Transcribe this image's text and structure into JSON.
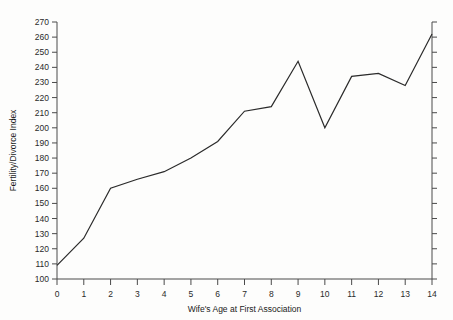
{
  "chart_data": {
    "type": "line",
    "title": "",
    "subtitle": "",
    "xlabel": "Wife's Age at First Association",
    "ylabel": "Fertility/Divorce Index",
    "x": [
      0,
      1,
      2,
      3,
      4,
      5,
      6,
      7,
      8,
      9,
      10,
      11,
      12,
      13,
      14
    ],
    "values": [
      109,
      127,
      160,
      166,
      171,
      180,
      191,
      211,
      214,
      244,
      200,
      234,
      236,
      228,
      262
    ],
    "series": [
      {
        "name": "Fertility/Divorce Index",
        "values": [
          109,
          127,
          160,
          166,
          171,
          180,
          191,
          211,
          214,
          244,
          200,
          234,
          236,
          228,
          262
        ]
      }
    ],
    "xlim": [
      0,
      14
    ],
    "ylim": [
      100,
      270
    ],
    "xticks": [
      "0",
      "1",
      "2",
      "3",
      "4",
      "5",
      "6",
      "7",
      "8",
      "9",
      "10",
      "11",
      "12",
      "13",
      "14"
    ],
    "yticks": [
      "100",
      "110",
      "120",
      "130",
      "140",
      "150",
      "160",
      "170",
      "180",
      "190",
      "200",
      "210",
      "220",
      "230",
      "240",
      "250",
      "260",
      "270"
    ],
    "grid": false,
    "legend": "none",
    "line_color": "#2b2b2b",
    "axis_color": "#4a4a4a",
    "background_color": "#fdfdfc"
  },
  "axes": {
    "x_axis_title": "Wife's Age at First Association",
    "y_axis_title": "Fertility/Divorce Index"
  }
}
